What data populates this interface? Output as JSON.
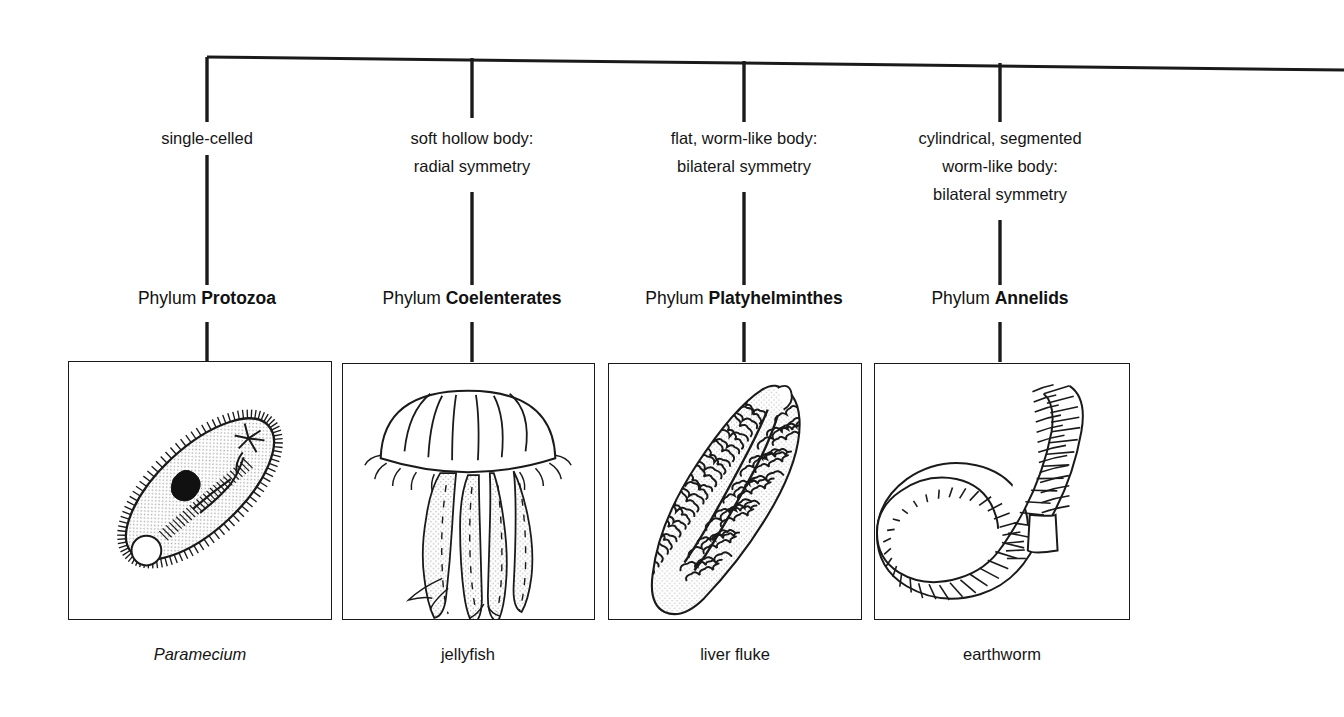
{
  "diagram": {
    "line_color": "#1a1a1a",
    "background_color": "#ffffff",
    "branches": [
      {
        "id": "protozoa",
        "trait": "single-celled",
        "phylum_word": "Phylum",
        "phylum_name": "Protozoa",
        "caption": "Paramecium",
        "caption_italic": true,
        "specimen_icon": "paramecium-icon"
      },
      {
        "id": "coelenterates",
        "trait": "soft hollow body:\nradial symmetry",
        "phylum_word": "Phylum",
        "phylum_name": "Coelenterates",
        "caption": "jellyfish",
        "caption_italic": false,
        "specimen_icon": "jellyfish-icon"
      },
      {
        "id": "platyhelminthes",
        "trait": "flat, worm-like body:\nbilateral symmetry",
        "phylum_word": "Phylum",
        "phylum_name": "Platyhelminthes",
        "caption": "liver fluke",
        "caption_italic": false,
        "specimen_icon": "liver-fluke-icon"
      },
      {
        "id": "annelids",
        "trait": "cylindrical, segmented\nworm-like body:\nbilateral symmetry",
        "phylum_word": "Phylum",
        "phylum_name": "Annelids",
        "caption": "earthworm",
        "caption_italic": false,
        "specimen_icon": "earthworm-icon"
      }
    ]
  }
}
